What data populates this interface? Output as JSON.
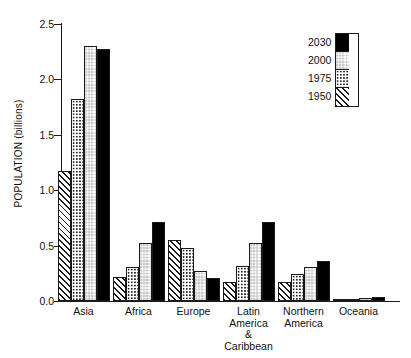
{
  "chart_data": {
    "type": "bar",
    "title": "",
    "xlabel": "",
    "ylabel": "POPULATION (billions)",
    "ylim": [
      0.0,
      2.5
    ],
    "ytick_labels": [
      "0.0",
      "0.5",
      "1.0",
      "1.5",
      "2.0",
      "2.5"
    ],
    "ytick_values": [
      0.0,
      0.5,
      1.0,
      1.5,
      2.0,
      2.5
    ],
    "grid": false,
    "legend_position": "top-right",
    "categories": [
      "Asia",
      "Africa",
      "Europe",
      "Latin America & Caribbean",
      "Northern America",
      "Oceania"
    ],
    "category_label_lines": [
      [
        "Asia"
      ],
      [
        "Africa"
      ],
      [
        "Europe"
      ],
      [
        "Latin America",
        "& Caribbean"
      ],
      [
        "Northern",
        "America"
      ],
      [
        "Oceania"
      ]
    ],
    "series": [
      {
        "name": "1950",
        "pattern": "diagonal-hatch",
        "values": [
          1.17,
          0.22,
          0.55,
          0.17,
          0.17,
          0.01
        ]
      },
      {
        "name": "1975",
        "pattern": "sparse-dots",
        "values": [
          1.82,
          0.31,
          0.48,
          0.32,
          0.24,
          0.02
        ]
      },
      {
        "name": "2000",
        "pattern": "checkerboard",
        "values": [
          2.3,
          0.52,
          0.27,
          0.52,
          0.31,
          0.03
        ]
      },
      {
        "name": "2030",
        "pattern": "solid-black",
        "values": [
          2.27,
          0.71,
          0.21,
          0.71,
          0.36,
          0.04
        ]
      }
    ],
    "legend_entries": [
      {
        "label": "2030",
        "pattern": "solid-black"
      },
      {
        "label": "2000",
        "pattern": "checkerboard"
      },
      {
        "label": "1975",
        "pattern": "sparse-dots"
      },
      {
        "label": "1950",
        "pattern": "diagonal-hatch"
      }
    ]
  }
}
